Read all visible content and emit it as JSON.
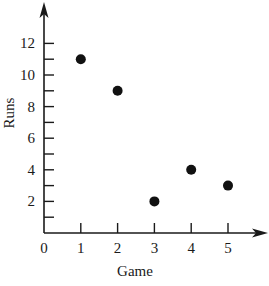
{
  "chart_data": {
    "type": "scatter",
    "title": "",
    "xlabel": "Game",
    "ylabel": "Runs",
    "x": [
      1,
      2,
      3,
      4,
      5
    ],
    "y": [
      11,
      9,
      2,
      4,
      3
    ],
    "points": [
      {
        "game": 1,
        "runs": 11
      },
      {
        "game": 2,
        "runs": 9
      },
      {
        "game": 3,
        "runs": 2
      },
      {
        "game": 4,
        "runs": 4
      },
      {
        "game": 5,
        "runs": 3
      }
    ],
    "xlim": [
      0,
      6
    ],
    "ylim": [
      0,
      13
    ],
    "x_ticks": [
      1,
      2,
      3,
      4,
      5
    ],
    "x_tick_labels": [
      "0",
      "1",
      "2",
      "3",
      "4",
      "5"
    ],
    "y_ticks": [
      1,
      2,
      3,
      4,
      5,
      6,
      7,
      8,
      9,
      10,
      11,
      12
    ],
    "y_tick_labels": [
      "2",
      "4",
      "6",
      "8",
      "10",
      "12"
    ],
    "grid": false,
    "legend": null,
    "marker_color": "#111111",
    "axis_color": "#1a1a1a"
  }
}
